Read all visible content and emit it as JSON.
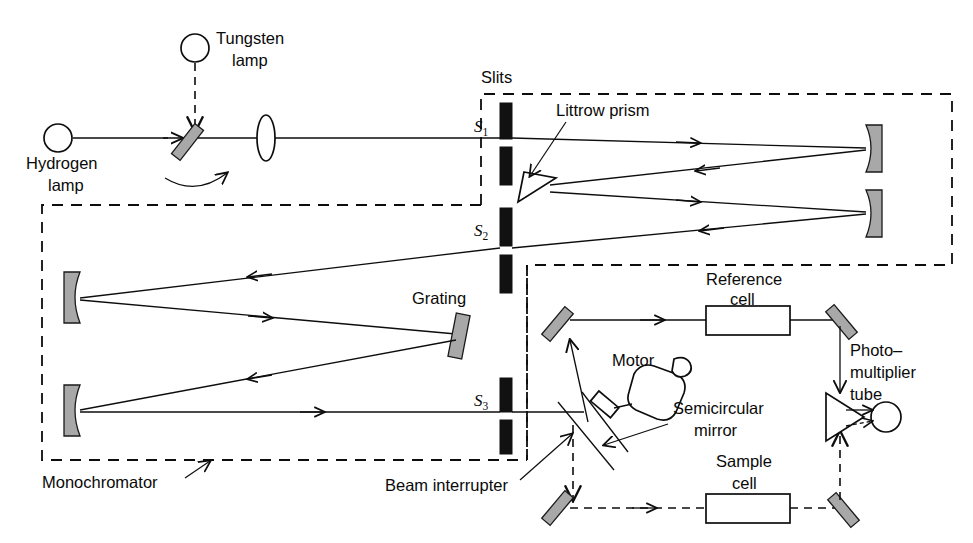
{
  "figure": {
    "background_color": "#ffffff",
    "line_color": "#0d0d0d",
    "mirror_fill": "#a8a8a8",
    "slit_fill": "#111111"
  },
  "labels": {
    "tungsten_lamp": "Tungsten\nlamp",
    "tungsten_lamp_line1": "Tungsten",
    "tungsten_lamp_line2": "lamp",
    "hydrogen_lamp_line1": "Hydrogen",
    "hydrogen_lamp_line2": "lamp",
    "slits": "Slits",
    "littrow_prism": "Littrow prism",
    "grating": "Grating",
    "monochromator": "Monochromator",
    "beam_interrupter": "Beam interrupter",
    "motor": "Motor",
    "semicircular_mirror_line1": "Semicircular",
    "semicircular_mirror_line2": "mirror",
    "reference_cell_line1": "Reference",
    "reference_cell_line2": "cell",
    "sample_cell_line1": "Sample",
    "sample_cell_line2": "cell",
    "pmt_line1": "Photo–",
    "pmt_line2": "multiplier",
    "pmt_line3": "tube",
    "slit_s1": "S",
    "slit_s1_sub": "1",
    "slit_s2": "S",
    "slit_s2_sub": "2",
    "slit_s3": "S",
    "slit_s3_sub": "3"
  },
  "components": [
    {
      "id": "hydrogen-lamp",
      "type": "source",
      "label": "Hydrogen lamp",
      "shape": "circle"
    },
    {
      "id": "tungsten-lamp",
      "type": "source",
      "label": "Tungsten lamp",
      "shape": "circle"
    },
    {
      "id": "rotating-mirror",
      "type": "mirror",
      "label": "rotating source select mirror",
      "shape": "tilted-bar"
    },
    {
      "id": "lens",
      "type": "lens",
      "label": "condensing lens",
      "shape": "lens"
    },
    {
      "id": "slit-s1",
      "type": "slit",
      "label": "S1"
    },
    {
      "id": "slit-s2",
      "type": "slit",
      "label": "S2"
    },
    {
      "id": "slit-s3",
      "type": "slit",
      "label": "S3"
    },
    {
      "id": "littrow-prism",
      "type": "prism",
      "label": "Littrow prism",
      "shape": "triangle"
    },
    {
      "id": "prism-mirror-upper",
      "type": "concave-mirror",
      "label": "upper collimating mirror"
    },
    {
      "id": "prism-mirror-lower",
      "type": "concave-mirror",
      "label": "lower collimating mirror"
    },
    {
      "id": "grating",
      "type": "grating",
      "label": "Grating",
      "shape": "tilted-bar"
    },
    {
      "id": "grating-mirror-upper",
      "type": "concave-mirror",
      "label": "upper monochromator mirror"
    },
    {
      "id": "grating-mirror-lower",
      "type": "concave-mirror",
      "label": "lower monochromator mirror"
    },
    {
      "id": "semicircular-mirror",
      "type": "chopper",
      "label": "Semicircular mirror"
    },
    {
      "id": "motor",
      "type": "motor",
      "label": "Motor"
    },
    {
      "id": "reference-cell",
      "type": "cuvette",
      "label": "Reference cell"
    },
    {
      "id": "sample-cell",
      "type": "cuvette",
      "label": "Sample cell"
    },
    {
      "id": "pmt",
      "type": "detector",
      "label": "Photomultiplier tube"
    }
  ],
  "enclosures": [
    {
      "id": "slits-enclosure",
      "label": "Slits"
    },
    {
      "id": "monochromator-enclosure",
      "label": "Monochromator"
    },
    {
      "id": "sample-compartment-enclosure",
      "label": "Beam interrupter"
    }
  ],
  "beams": [
    {
      "id": "source-beam",
      "style": "solid",
      "note": "hydrogen lamp to slit S1"
    },
    {
      "id": "tungsten-beam",
      "style": "dashed",
      "note": "tungsten lamp down to rotating mirror"
    },
    {
      "id": "prism-beams",
      "style": "solid",
      "note": "S1 to upper mirror to prism to lower mirror to S2"
    },
    {
      "id": "grating-beams",
      "style": "solid",
      "note": "S2 to mirror to grating to mirror to S3"
    },
    {
      "id": "reference-beam",
      "style": "solid",
      "note": "semicircular mirror via reference cell to PMT"
    },
    {
      "id": "sample-beam",
      "style": "dashed",
      "note": "through sample cell to PMT"
    }
  ]
}
